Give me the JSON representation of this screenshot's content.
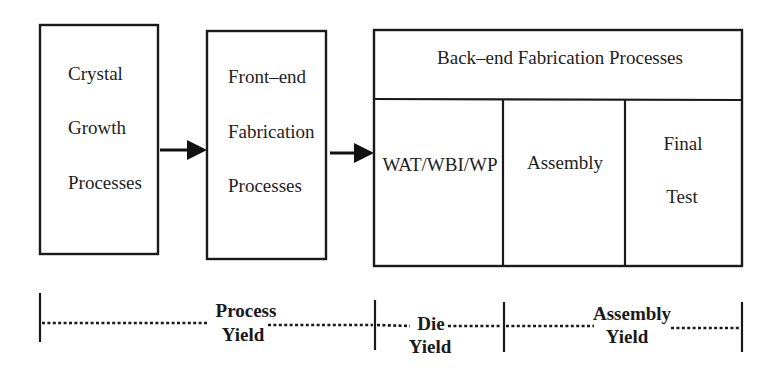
{
  "diagram": {
    "colors": {
      "stroke": "#1a1a1a",
      "text": "#1e1e1e",
      "background": "#ffffff"
    },
    "boxes": {
      "crystal_growth": {
        "lines": [
          "Crystal",
          "Growth",
          "Processes"
        ]
      },
      "front_end": {
        "lines": [
          "Front–end",
          "Fabrication",
          "Processes"
        ]
      },
      "back_end": {
        "header": "Back–end Fabrication Processes",
        "columns": [
          {
            "lines": [
              "WAT/WBI/WP"
            ]
          },
          {
            "lines": [
              "Assembly"
            ]
          },
          {
            "lines": [
              "Final",
              "Test"
            ]
          }
        ]
      }
    },
    "arrows": [
      {
        "from": "crystal_growth",
        "to": "front_end"
      },
      {
        "from": "front_end",
        "to": "back_end"
      }
    ],
    "yields": [
      {
        "lines": [
          "Process",
          "Yield"
        ],
        "spans": "Crystal Growth + Front-end"
      },
      {
        "lines": [
          "Die",
          "Yield"
        ],
        "spans": "WAT/WBI/WP"
      },
      {
        "lines": [
          "Assembly",
          "Yield"
        ],
        "spans": "Assembly + Final Test"
      }
    ]
  }
}
